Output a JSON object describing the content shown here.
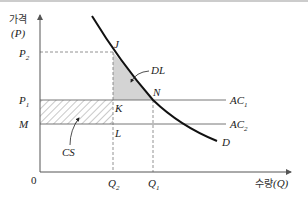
{
  "diagram": {
    "y_axis_label_kr": "가격",
    "y_axis_label_sym": "(P)",
    "x_axis_label_kr": "수량",
    "x_axis_label_sym": "(Q)",
    "origin_label": "0",
    "price_levels": {
      "P2": {
        "base": "P",
        "sub": "2"
      },
      "P1": {
        "base": "P",
        "sub": "1"
      },
      "M": "M"
    },
    "quantity_levels": {
      "Q2": {
        "base": "Q",
        "sub": "2"
      },
      "Q1": {
        "base": "Q",
        "sub": "1"
      }
    },
    "points": {
      "J": "J",
      "K": "K",
      "N": "N",
      "L": "L"
    },
    "curves": {
      "demand": "D",
      "AC1": {
        "base": "AC",
        "sub": "1"
      },
      "AC2": {
        "base": "AC",
        "sub": "2"
      }
    },
    "areas": {
      "deadweight_loss": "DL",
      "cost_saving": "CS"
    },
    "colors": {
      "axis": "#555555",
      "demand_curve": "#111111",
      "ac_lines": "#666666",
      "dl_fill": "#d4d4d4",
      "hatch": "#777777",
      "border_top": "#999999"
    }
  }
}
